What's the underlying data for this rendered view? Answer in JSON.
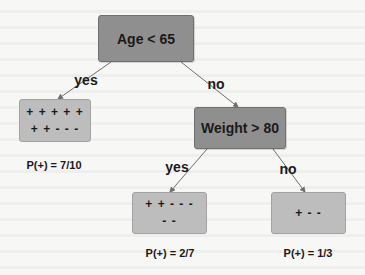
{
  "diagram": {
    "type": "decision-tree",
    "nodes": {
      "root": {
        "label": "Age < 65"
      },
      "weight": {
        "label": "Weight > 80"
      },
      "leaf_left": {
        "lines": [
          "+ + + + +",
          "+ + - - -"
        ],
        "probability": "P(+) = 7/10"
      },
      "leaf_mid": {
        "lines": [
          "+ + - - -",
          "- -"
        ],
        "probability": "P(+) = 2/7"
      },
      "leaf_right": {
        "lines": [
          "+ - -"
        ],
        "probability": "P(+) = 1/3"
      }
    },
    "edges": [
      {
        "from": "root",
        "to": "leaf_left",
        "label": "yes"
      },
      {
        "from": "root",
        "to": "weight",
        "label": "no"
      },
      {
        "from": "weight",
        "to": "leaf_mid",
        "label": "yes"
      },
      {
        "from": "weight",
        "to": "leaf_right",
        "label": "no"
      }
    ],
    "colors": {
      "decision_fill": "#8f8f8f",
      "leaf_fill": "#bdbdbd",
      "edge": "#6e6e6e",
      "text": "#1a1a1a",
      "background": "#f7f7f5"
    }
  }
}
